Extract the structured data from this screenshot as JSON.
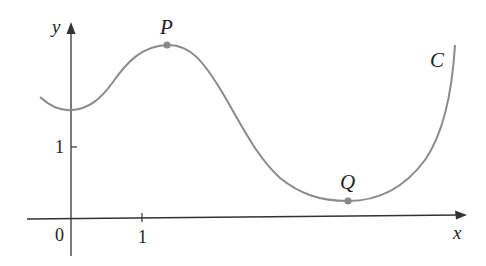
{
  "diagram": {
    "type": "function-curve",
    "curve_label": "C",
    "axes": {
      "x_label": "x",
      "y_label": "y",
      "origin_label": "0",
      "x_tick_label": "1",
      "y_tick_label": "1"
    },
    "points": [
      {
        "name": "P",
        "description": "local maximum"
      },
      {
        "name": "Q",
        "description": "local minimum"
      }
    ],
    "colors": {
      "curve": "#8a8a8a",
      "axes": "#333333",
      "text": "#222222"
    }
  }
}
